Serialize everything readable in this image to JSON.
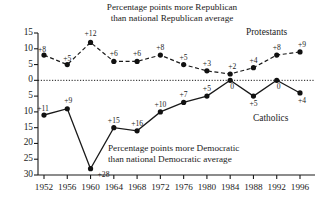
{
  "chart_data": {
    "type": "line",
    "title": "Percentage points more Republican\nthan national Republican average",
    "title_line1": "Percentage points more Republican",
    "title_line2": "than national Republican average",
    "annotation_line1": "Percentage points more Democratic",
    "annotation_line2": "than national Democratic average",
    "xlabel": "",
    "ylabel": "",
    "grid": false,
    "legend_position": "inline-right",
    "categories": [
      "1952",
      "1956",
      "1960",
      "1964",
      "1968",
      "1972",
      "1976",
      "1980",
      "1984",
      "1988",
      "1992",
      "1996"
    ],
    "x": [
      1952,
      1956,
      1960,
      1964,
      1968,
      1972,
      1976,
      1980,
      1984,
      1988,
      1992,
      1996
    ],
    "y_tick_labels": [
      "15",
      "10",
      "5",
      "0",
      "5",
      "10",
      "15",
      "20",
      "25",
      "30"
    ],
    "y_tick_values": [
      15,
      10,
      5,
      0,
      -5,
      -10,
      -15,
      -20,
      -25,
      -30
    ],
    "ylim": [
      -30,
      15
    ],
    "series": [
      {
        "name": "Protestants",
        "style": "dashed",
        "values": [
          8,
          5,
          12,
          6,
          6,
          8,
          5,
          3,
          2,
          4,
          8,
          9
        ],
        "labels": [
          "+8",
          "+5",
          "+12",
          "+6",
          "+6",
          "+8",
          "+5",
          "+3",
          "+2",
          "+4",
          "+8",
          "+9"
        ]
      },
      {
        "name": "Catholics",
        "style": "solid",
        "values": [
          -11,
          -9,
          -28,
          -15,
          -16,
          -10,
          -7,
          -5,
          0,
          -5,
          0,
          -4
        ],
        "labels": [
          "+11",
          "+9",
          "+28",
          "+15",
          "+16",
          "+10",
          "+7",
          "+5",
          "0",
          "+5",
          "0",
          "+4"
        ]
      }
    ]
  }
}
